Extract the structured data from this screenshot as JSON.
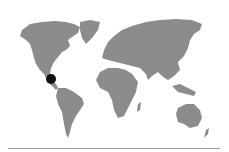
{
  "map": {
    "type": "world-map",
    "land_color": "#8c8c8c",
    "background_color": "#ffffff",
    "marker": {
      "label": "location-marker",
      "region": "Mexico / Central America",
      "color": "#111111",
      "x": 51,
      "y": 79,
      "radius": 5
    },
    "divider": {
      "color": "#9a9a9a"
    }
  }
}
